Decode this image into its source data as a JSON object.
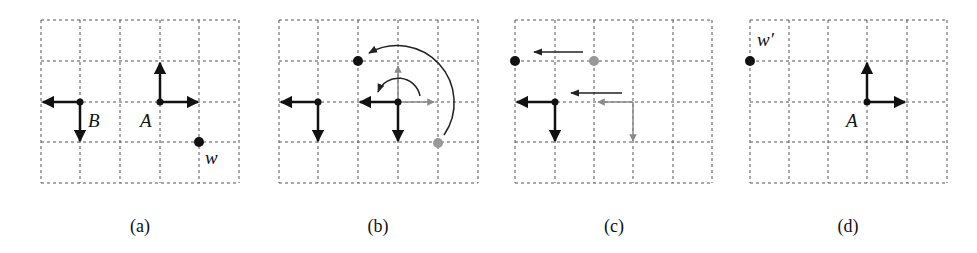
{
  "figure": {
    "panels": [
      {
        "id": "a",
        "caption": "(a)",
        "labels": {
          "B": "B",
          "A": "A",
          "w": "w"
        }
      },
      {
        "id": "b",
        "caption": "(b)"
      },
      {
        "id": "c",
        "caption": "(c)"
      },
      {
        "id": "d",
        "caption": "(d)",
        "labels": {
          "w_prime": "w′",
          "A": "A"
        }
      }
    ],
    "grid": {
      "columns": 5,
      "rows": 4,
      "line_style": "dashed"
    },
    "colors": {
      "primary": "#111111",
      "secondary": "#8a8a8a",
      "grid": "#555555"
    }
  }
}
